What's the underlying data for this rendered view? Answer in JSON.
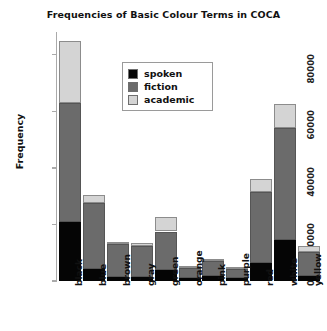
{
  "chart_data": {
    "type": "bar",
    "subtype": "stacked-bar",
    "title": "Frequencies of Basic Colour Terms in COCA",
    "xlabel": "",
    "ylabel": "Frequency",
    "categories": [
      "black",
      "blue",
      "brown",
      "gray",
      "green",
      "orange",
      "pink",
      "purple",
      "red",
      "white",
      "yellow"
    ],
    "series": [
      {
        "name": "spoken",
        "color": "#050505",
        "values": [
          21000,
          4200,
          1500,
          1500,
          4000,
          1200,
          1700,
          1100,
          6500,
          14500,
          1700
        ]
      },
      {
        "name": "fiction",
        "color": "#6b6b6b",
        "values": [
          42000,
          23500,
          11500,
          11000,
          13500,
          3500,
          5500,
          3000,
          25000,
          39500,
          8500
        ]
      },
      {
        "name": "academic",
        "color": "#d4d4d4",
        "values": [
          22000,
          2800,
          800,
          900,
          5000,
          400,
          500,
          400,
          4500,
          8500,
          2000
        ]
      }
    ],
    "totals": [
      85000,
      30500,
      13800,
      13400,
      22500,
      5100,
      7700,
      4500,
      36000,
      62500,
      12200
    ],
    "yticks": [
      0,
      20000,
      40000,
      60000,
      80000
    ],
    "ytick_labels": [
      "0",
      "20000",
      "40000",
      "60000",
      "80000"
    ],
    "ylim": [
      0,
      88000
    ],
    "grid": false,
    "legend_position": "upper-center",
    "legend_entries": [
      "spoken",
      "fiction",
      "academic"
    ]
  }
}
